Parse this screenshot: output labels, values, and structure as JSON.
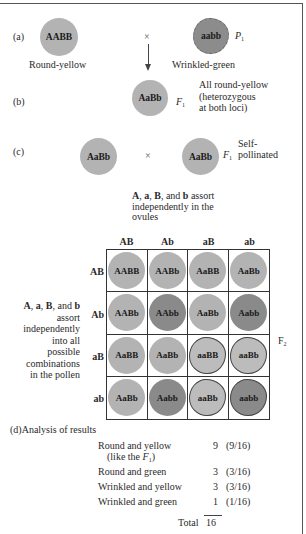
{
  "parents": {
    "label": "(a)",
    "left": {
      "genotype": "AABB",
      "phenotype": "Round-yellow"
    },
    "cross": "×",
    "right": {
      "genotype": "aabb",
      "phenotype": "Wrinkled-green"
    },
    "generation": "P",
    "generation_sub": "1"
  },
  "f1": {
    "label": "(b)",
    "genotype": "AaBb",
    "generation": "F",
    "generation_sub": "1",
    "note_line1": "All round-yellow",
    "note_line2": "(heterozygous",
    "note_line3": "at both loci)"
  },
  "selfing": {
    "label": "(c)",
    "left": "AaBb",
    "cross": "×",
    "right": "AaBb",
    "generation": "F",
    "generation_sub": "1",
    "note_line1": "Self-",
    "note_line2": "pollinated"
  },
  "ovules_note": {
    "A": "A",
    "sep1": ", ",
    "a": "a",
    "sep2": ", ",
    "B": "B",
    "sep3": ", and ",
    "b": "b",
    "rest_line1": " assort",
    "line2": "independently in the",
    "line3": "ovules"
  },
  "pollen_note": {
    "A": "A",
    "sep1": ", ",
    "a": "a",
    "sep2": ", ",
    "B": "B",
    "sep3": ", and ",
    "b": "b",
    "lines": [
      "assort",
      "independently",
      "into all",
      "possible",
      "combinations",
      "in the pollen"
    ]
  },
  "punnett": {
    "columns": [
      "AB",
      "Ab",
      "aB",
      "ab"
    ],
    "rows": [
      "AB",
      "Ab",
      "aB",
      "ab"
    ],
    "generation": "F",
    "generation_sub": "2",
    "cells": [
      [
        "AABB",
        "AABb",
        "AaBB",
        "AaBb"
      ],
      [
        "AABb",
        "AAbb",
        "AaBb",
        "Aabb"
      ],
      [
        "AaBB",
        "AaBb",
        "aaBB",
        "aaBb"
      ],
      [
        "AaBb",
        "Aabb",
        "aaBb",
        "aabb"
      ]
    ]
  },
  "analysis": {
    "label": "(d)",
    "title": "Analysis of results",
    "rows": [
      {
        "name": "Round and yellow",
        "count": "9",
        "fraction": "(9/16)"
      },
      {
        "name": "Round and green",
        "count": "3",
        "fraction": "(3/16)"
      },
      {
        "name": "Wrinkled and yellow",
        "count": "3",
        "fraction": "(3/16)"
      },
      {
        "name": "Wrinkled and green",
        "count": "1",
        "fraction": "(1/16)"
      }
    ],
    "round_yellow_note_prefix": "(like the ",
    "round_yellow_note_F": "F",
    "round_yellow_note_sub": "1",
    "round_yellow_note_suffix": ")",
    "total_label": "Total",
    "total_value": "16"
  },
  "colors": {
    "yellow_pea": "#b3b3b3",
    "green_pea": "#8a8a8a",
    "border": "#333333"
  }
}
